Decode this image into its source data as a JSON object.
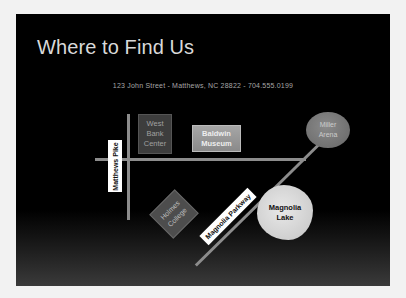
{
  "slide": {
    "title": "Where to Find Us",
    "address": "123 John Street  -  Matthews, NC 28822  -  704.555.0199"
  },
  "map": {
    "roads": [
      {
        "name": "Matthews Pike",
        "label": "Matthews Pike",
        "orientation": "vertical"
      },
      {
        "name": "Cross Street",
        "orientation": "horizontal"
      },
      {
        "name": "Magnolia Parkway",
        "label": "Magnolia Parkway",
        "orientation": "diagonal"
      }
    ],
    "landmarks": {
      "west_bank": {
        "line1": "West",
        "line2": "Bank",
        "line3": "Center"
      },
      "baldwin": {
        "line1": "Baldwin",
        "line2": "Museum"
      },
      "miller": {
        "line1": "Miller",
        "line2": "Arena"
      },
      "holmes": {
        "line1": "Holmes",
        "line2": "College"
      },
      "lake": {
        "line1": "Magnolia",
        "line2": "Lake"
      }
    }
  },
  "colors": {
    "slide_bg": "#000000",
    "road": "#8c8c8c",
    "title_text": "#d9d9d9"
  }
}
